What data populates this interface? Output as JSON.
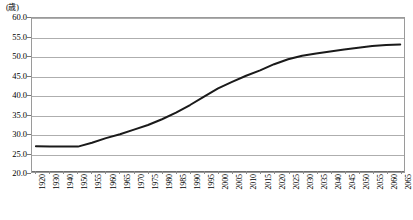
{
  "chart_data": {
    "type": "line",
    "title": "",
    "subtitle": "",
    "xlabel": "",
    "ylabel": "",
    "unit_label": "(歳)",
    "ylim": [
      20.0,
      60.0
    ],
    "ytick_step": 5.0,
    "yticks": [
      "60.0",
      "55.0",
      "50.0",
      "45.0",
      "40.0",
      "35.0",
      "30.0",
      "25.0",
      "20.0"
    ],
    "ytick_values": [
      60.0,
      55.0,
      50.0,
      45.0,
      40.0,
      35.0,
      30.0,
      25.0,
      20.0
    ],
    "grid": true,
    "legend": "none",
    "xtick_labels": [
      "1920",
      "1930",
      "1940",
      "1950",
      "1955",
      "1960",
      "1965",
      "1970",
      "1975",
      "1980",
      "1985",
      "1990",
      "1995",
      "2000",
      "2005",
      "2010",
      "2015",
      "2020",
      "2025",
      "2030",
      "2035",
      "2040",
      "2045",
      "2050",
      "2055",
      "2060",
      "2065"
    ],
    "categories": [
      "1920",
      "1930",
      "1940",
      "1950",
      "1955",
      "1960",
      "1965",
      "1970",
      "1975",
      "1980",
      "1985",
      "1990",
      "1995",
      "2000",
      "2005",
      "2010",
      "2015",
      "2020",
      "2025",
      "2030",
      "2035",
      "2040",
      "2045",
      "2050",
      "2055",
      "2060",
      "2065"
    ],
    "values": [
      26.7,
      26.6,
      26.6,
      26.6,
      27.6,
      28.8,
      29.8,
      31.0,
      32.2,
      33.7,
      35.4,
      37.4,
      39.6,
      41.7,
      43.4,
      45.0,
      46.4,
      48.0,
      49.3,
      50.2,
      50.8,
      51.3,
      51.8,
      52.3,
      52.7,
      53.0,
      53.1
    ],
    "series": [
      {
        "name": "平均年齢",
        "color": "#1a1a1a",
        "values": [
          26.7,
          26.6,
          26.6,
          26.6,
          27.6,
          28.8,
          29.8,
          31.0,
          32.2,
          33.7,
          35.4,
          37.4,
          39.6,
          41.7,
          43.4,
          45.0,
          46.4,
          48.0,
          49.3,
          50.2,
          50.8,
          51.3,
          51.8,
          52.3,
          52.7,
          53.0,
          53.1
        ]
      }
    ],
    "colors": {
      "series_line": "#1a1a1a",
      "gridline": "#aeaeae",
      "axis": "#6e6e6e",
      "plot_border": "#9a9a9a",
      "background": "#ffffff",
      "text": "#000000"
    }
  }
}
